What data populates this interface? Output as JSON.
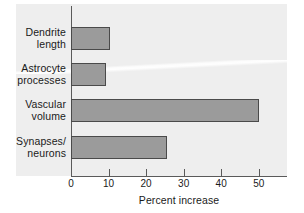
{
  "chart_data": {
    "type": "bar",
    "orientation": "horizontal",
    "title": "",
    "xlabel": "Percent increase",
    "ylabel": "",
    "categories": [
      "Dendrite length",
      "Astrocyte processes",
      "Vascular volume",
      "Synapses/ neurons"
    ],
    "category_lines": [
      [
        "Dendrite",
        "length"
      ],
      [
        "Astrocyte",
        "processes"
      ],
      [
        "Vascular",
        "volume"
      ],
      [
        "Synapses/",
        "neurons"
      ]
    ],
    "values": [
      10.5,
      9.4,
      50.0,
      25.5
    ],
    "xlim": [
      0,
      57.5
    ],
    "xticks": [
      0,
      10,
      20,
      30,
      40,
      50
    ],
    "xtick_labels": [
      "0",
      "10",
      "20",
      "30",
      "40",
      "50"
    ],
    "grid": false,
    "legend": null,
    "bar_fill_color": "#9b9b9b",
    "bar_edge_color": "#4a4a4a",
    "panel_background_color": "#eeeeee",
    "axis_color": "#5a5a5a",
    "text_color": "#1a1a1a"
  }
}
